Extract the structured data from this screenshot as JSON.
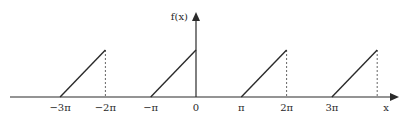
{
  "chart_data": {
    "type": "line",
    "title": "",
    "xlabel": "x",
    "ylabel": "f(x)",
    "x_ticks": [
      "−3π",
      "−2π",
      "−π",
      "0",
      "π",
      "2π",
      "3π"
    ],
    "x_tick_values": [
      -3,
      -2,
      -1,
      0,
      1,
      2,
      3
    ],
    "x_units": "π",
    "segments": [
      {
        "x": [
          -3,
          -2
        ],
        "y": [
          0,
          1
        ],
        "dashed_drop_at": -2
      },
      {
        "x": [
          -1,
          0
        ],
        "y": [
          0,
          1
        ],
        "dashed_drop_at": 0
      },
      {
        "x": [
          1,
          2
        ],
        "y": [
          0,
          1
        ],
        "dashed_drop_at": 2
      },
      {
        "x": [
          3,
          4
        ],
        "y": [
          0,
          1
        ],
        "dashed_drop_at": 4
      }
    ],
    "xlim": [
      -4.1,
      4.5
    ],
    "ylim": [
      0,
      1.9
    ],
    "grid": false,
    "legend": null
  },
  "axes": {
    "x_label": "x",
    "y_label": "f(x)"
  }
}
